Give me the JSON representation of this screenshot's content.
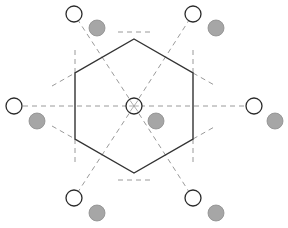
{
  "diagram": {
    "width": 288,
    "height": 228,
    "colors": {
      "background": "#ffffff",
      "hexagon_stroke": "#333333",
      "dashed_line": "#9a9a9a",
      "open_circle_stroke": "#2a2a2a",
      "filled_circle_fill": "#a6a6a6",
      "filled_circle_stroke": "#8c8c8c"
    },
    "center": {
      "x": 134,
      "y": 106,
      "r": 8
    },
    "hexagon": {
      "vertices": [
        [
          134,
          39
        ],
        [
          193,
          73
        ],
        [
          193,
          139
        ],
        [
          134,
          173
        ],
        [
          75,
          139
        ],
        [
          75,
          73
        ]
      ]
    },
    "open_circles": [
      {
        "x": 74,
        "y": 14,
        "r": 8
      },
      {
        "x": 193,
        "y": 14,
        "r": 8
      },
      {
        "x": 14,
        "y": 106,
        "r": 8
      },
      {
        "x": 254,
        "y": 106,
        "r": 8
      },
      {
        "x": 74,
        "y": 198,
        "r": 8
      },
      {
        "x": 193,
        "y": 198,
        "r": 8
      }
    ],
    "filled_circles": [
      {
        "x": 97,
        "y": 28,
        "r": 8
      },
      {
        "x": 216,
        "y": 28,
        "r": 8
      },
      {
        "x": 37,
        "y": 121,
        "r": 8
      },
      {
        "x": 156,
        "y": 121,
        "r": 8
      },
      {
        "x": 275,
        "y": 121,
        "r": 8
      },
      {
        "x": 97,
        "y": 213,
        "r": 8
      },
      {
        "x": 216,
        "y": 213,
        "r": 8
      }
    ],
    "radial_dashed_lines": [
      [
        [
          134,
          106
        ],
        [
          74,
          14
        ]
      ],
      [
        [
          134,
          106
        ],
        [
          193,
          14
        ]
      ],
      [
        [
          14,
          106
        ],
        [
          254,
          106
        ]
      ],
      [
        [
          134,
          106
        ],
        [
          74,
          198
        ]
      ],
      [
        [
          134,
          106
        ],
        [
          193,
          198
        ]
      ]
    ],
    "vertex_dashed_lines": [
      [
        [
          118,
          32
        ],
        [
          150,
          32
        ]
      ],
      [
        [
          118,
          180
        ],
        [
          150,
          180
        ]
      ],
      [
        [
          75,
          50
        ],
        [
          75,
          73
        ]
      ],
      [
        [
          52,
          86
        ],
        [
          75,
          73
        ]
      ],
      [
        [
          75,
          139
        ],
        [
          75,
          162
        ]
      ],
      [
        [
          52,
          126
        ],
        [
          75,
          139
        ]
      ],
      [
        [
          193,
          50
        ],
        [
          193,
          73
        ]
      ],
      [
        [
          193,
          73
        ],
        [
          216,
          86
        ]
      ],
      [
        [
          193,
          139
        ],
        [
          193,
          162
        ]
      ],
      [
        [
          193,
          139
        ],
        [
          216,
          126
        ]
      ]
    ]
  }
}
